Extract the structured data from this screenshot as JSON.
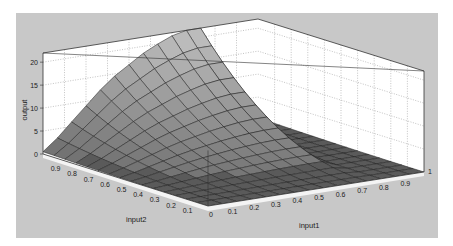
{
  "chart_data": {
    "type": "surface",
    "title": "",
    "xlabel": "input1",
    "ylabel": "input2",
    "zlabel": "output",
    "xlim": [
      0,
      1
    ],
    "ylim": [
      0,
      1
    ],
    "zlim": [
      0,
      22
    ],
    "x_ticks": [
      "0",
      "0.1",
      "0.2",
      "0.3",
      "0.4",
      "0.5",
      "0.6",
      "0.7",
      "0.8",
      "0.9",
      "1"
    ],
    "y_ticks": [
      "0.1",
      "0.2",
      "0.3",
      "0.4",
      "0.5",
      "0.6",
      "0.7",
      "0.8",
      "0.9"
    ],
    "z_ticks": [
      "0",
      "5",
      "10",
      "15",
      "20"
    ],
    "grid": true,
    "grid_x": [
      0,
      0.067,
      0.133,
      0.2,
      0.267,
      0.333,
      0.4,
      0.467,
      0.533,
      0.6,
      0.667,
      0.733,
      0.8,
      0.867,
      0.933,
      1
    ],
    "grid_y": [
      0,
      0.067,
      0.133,
      0.2,
      0.267,
      0.333,
      0.4,
      0.467,
      0.533,
      0.6,
      0.667,
      0.733,
      0.8,
      0.867,
      0.933,
      1
    ],
    "surface_description": "Output near 0 over most of the domain; rises with input2 toward 1 and peaks around 22 at input1≈0.55-0.6, input2=1, dropping sharply to ~0 for input1 > 0.65.",
    "z_peak_profile_at_input2_1": [
      0.5,
      3,
      6,
      9,
      12,
      14.5,
      16.5,
      18.5,
      20,
      21.3,
      22,
      22,
      0.5,
      0.5,
      0.5,
      0.5
    ]
  },
  "figure": {
    "background": "#c8c8c8",
    "axes_background": "#ffffff",
    "surface_light": "#b8b8b8",
    "surface_dark": "#5a5a5a"
  }
}
